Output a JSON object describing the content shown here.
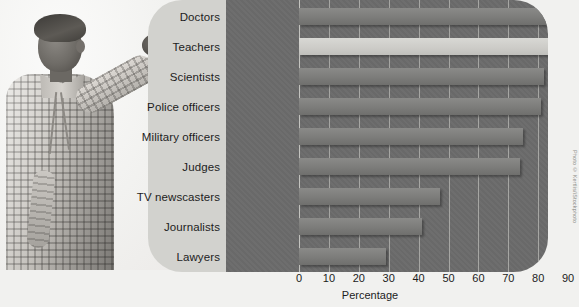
{
  "figure": {
    "axis_title": "Percentage",
    "credit": "Photo © Kertlis/iStockphoto",
    "photo_alt": "man-pointing-at-chart"
  },
  "chart_data": {
    "type": "bar",
    "orientation": "horizontal",
    "title": "",
    "xlabel": "Percentage",
    "ylabel": "",
    "xlim": [
      0,
      100
    ],
    "grid": true,
    "legend": "none",
    "highlight_category": "Teachers",
    "categories": [
      "Doctors",
      "Teachers",
      "Scientists",
      "Police officers",
      "Military officers",
      "Judges",
      "TV newscasters",
      "Journalists",
      "Lawyers"
    ],
    "values": [
      88,
      87,
      82,
      81,
      75,
      74,
      47,
      41,
      29
    ],
    "tick_labels": [
      "0",
      "10",
      "20",
      "30",
      "40",
      "50",
      "60",
      "70",
      "80",
      "90",
      "100"
    ],
    "tick_values": [
      0,
      10,
      20,
      30,
      40,
      50,
      60,
      70,
      80,
      90,
      100
    ]
  },
  "colors": {
    "plot_background": "#6b6b6b",
    "label_panel": "#d2d2ce",
    "bar": "#7c7c7a",
    "bar_highlight": "#cccbc7",
    "page_background": "#efefed",
    "text": "#1d1d1d"
  }
}
